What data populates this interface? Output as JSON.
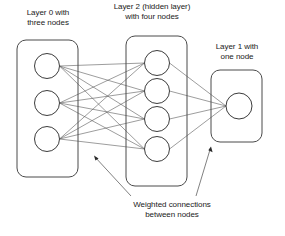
{
  "diagram": {
    "background_color": "#ffffff",
    "stroke_color": "#4a4a4a",
    "text_color": "#1a1a1a",
    "labels": {
      "layer0": "Layer 0 with\nthree nodes",
      "layer2": "Layer 2  (hidden layer)\nwith four nodes",
      "layer1": "Layer 1 with\none node",
      "weighted": "Weighted connections\nbetween nodes"
    },
    "layers": [
      {
        "name": "Layer 0",
        "role": "input",
        "node_count": 3,
        "box": {
          "x": 17,
          "y": 40,
          "w": 61,
          "h": 137,
          "r": 9
        },
        "nodes": [
          {
            "cx": 47,
            "cy": 66,
            "r": 12.5
          },
          {
            "cx": 47,
            "cy": 103,
            "r": 12.5
          },
          {
            "cx": 47,
            "cy": 139,
            "r": 12.5
          }
        ]
      },
      {
        "name": "Layer 2",
        "role": "hidden",
        "node_count": 4,
        "box": {
          "x": 126,
          "y": 36,
          "w": 61,
          "h": 150,
          "r": 9
        },
        "nodes": [
          {
            "cx": 157,
            "cy": 63,
            "r": 12.5
          },
          {
            "cx": 157,
            "cy": 91,
            "r": 12.5
          },
          {
            "cx": 157,
            "cy": 119,
            "r": 12.5
          },
          {
            "cx": 157,
            "cy": 149,
            "r": 12.5
          }
        ]
      },
      {
        "name": "Layer 1",
        "role": "output",
        "node_count": 1,
        "box": {
          "x": 211,
          "y": 70,
          "w": 51,
          "h": 72,
          "r": 9
        },
        "nodes": [
          {
            "cx": 239,
            "cy": 106,
            "r": 13
          }
        ]
      }
    ],
    "connections": {
      "input_to_hidden_count": 12,
      "hidden_to_output_count": 4,
      "fully_connected": true
    },
    "pointers": [
      {
        "from_x": 131,
        "from_y": 196,
        "to_x": 94,
        "to_y": 156
      },
      {
        "from_x": 196,
        "from_y": 196,
        "to_x": 211,
        "to_y": 147
      }
    ]
  }
}
